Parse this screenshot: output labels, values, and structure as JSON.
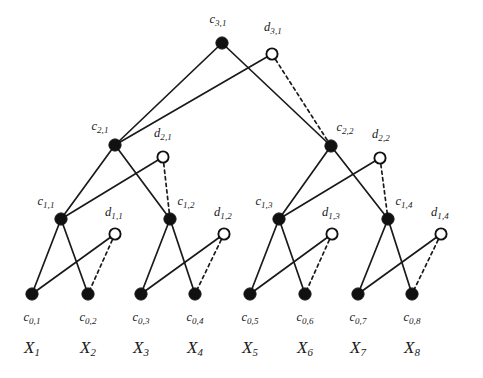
{
  "figure": {
    "type": "tree-diagram",
    "background_color": "#ffffff",
    "line_color": "#1a1a1a",
    "filled_node_color": "#111111",
    "open_node_fill": "#ffffff",
    "levels": 4,
    "leaf_count": 8
  },
  "nodes": {
    "approximation": [
      {
        "id": "c3_1",
        "label_c": "c",
        "label_sub": "3,1",
        "x": 222,
        "y": 43,
        "label_x": 218,
        "label_y": 19,
        "style": "filled",
        "level": 3
      },
      {
        "id": "c2_1",
        "label_c": "c",
        "label_sub": "2,1",
        "x": 115,
        "y": 145,
        "label_x": 100,
        "label_y": 126,
        "style": "filled",
        "level": 2
      },
      {
        "id": "c2_2",
        "label_c": "c",
        "label_sub": "2,2",
        "x": 331,
        "y": 146,
        "label_x": 345,
        "label_y": 127,
        "style": "filled",
        "level": 2
      },
      {
        "id": "c1_1",
        "label_c": "c",
        "label_sub": "1,1",
        "x": 61,
        "y": 219,
        "label_x": 46,
        "label_y": 201,
        "style": "filled",
        "level": 1
      },
      {
        "id": "c1_2",
        "label_c": "c",
        "label_sub": "1,2",
        "x": 170,
        "y": 219,
        "label_x": 186,
        "label_y": 201,
        "style": "filled",
        "level": 1
      },
      {
        "id": "c1_3",
        "label_c": "c",
        "label_sub": "1,3",
        "x": 279,
        "y": 219,
        "label_x": 264,
        "label_y": 201,
        "style": "filled",
        "level": 1
      },
      {
        "id": "c1_4",
        "label_c": "c",
        "label_sub": "1,4",
        "x": 388,
        "y": 219,
        "label_x": 404,
        "label_y": 201,
        "style": "filled",
        "level": 1
      },
      {
        "id": "c0_1",
        "label_c": "c",
        "label_sub": "0,1",
        "x": 32,
        "y": 294,
        "label_x": 32,
        "label_y": 317,
        "style": "filled",
        "level": 0
      },
      {
        "id": "c0_2",
        "label_c": "c",
        "label_sub": "0,2",
        "x": 88,
        "y": 294,
        "label_x": 88,
        "label_y": 317,
        "style": "filled",
        "level": 0
      },
      {
        "id": "c0_3",
        "label_c": "c",
        "label_sub": "0,3",
        "x": 141,
        "y": 294,
        "label_x": 141,
        "label_y": 317,
        "style": "filled",
        "level": 0
      },
      {
        "id": "c0_4",
        "label_c": "c",
        "label_sub": "0,4",
        "x": 195,
        "y": 294,
        "label_x": 195,
        "label_y": 317,
        "style": "filled",
        "level": 0
      },
      {
        "id": "c0_5",
        "label_c": "c",
        "label_sub": "0,5",
        "x": 250,
        "y": 294,
        "label_x": 250,
        "label_y": 317,
        "style": "filled",
        "level": 0
      },
      {
        "id": "c0_6",
        "label_c": "c",
        "label_sub": "0,6",
        "x": 305,
        "y": 294,
        "label_x": 305,
        "label_y": 317,
        "style": "filled",
        "level": 0
      },
      {
        "id": "c0_7",
        "label_c": "c",
        "label_sub": "0,7",
        "x": 358,
        "y": 294,
        "label_x": 358,
        "label_y": 317,
        "style": "filled",
        "level": 0
      },
      {
        "id": "c0_8",
        "label_c": "c",
        "label_sub": "0,8",
        "x": 412,
        "y": 294,
        "label_x": 412,
        "label_y": 317,
        "style": "filled",
        "level": 0
      }
    ],
    "detail": [
      {
        "id": "d3_1",
        "label_c": "d",
        "label_sub": "3,1",
        "x": 272,
        "y": 54,
        "label_x": 273,
        "label_y": 27,
        "style": "open",
        "level": 3
      },
      {
        "id": "d2_1",
        "label_c": "d",
        "label_sub": "2,1",
        "x": 163,
        "y": 157,
        "label_x": 163,
        "label_y": 133,
        "style": "open",
        "level": 2
      },
      {
        "id": "d2_2",
        "label_c": "d",
        "label_sub": "2,2",
        "x": 380,
        "y": 158,
        "label_x": 381,
        "label_y": 134,
        "style": "open",
        "level": 2
      },
      {
        "id": "d1_1",
        "label_c": "d",
        "label_sub": "1,1",
        "x": 115,
        "y": 234,
        "label_x": 114,
        "label_y": 212,
        "style": "open",
        "level": 1
      },
      {
        "id": "d1_2",
        "label_c": "d",
        "label_sub": "1,2",
        "x": 224,
        "y": 234,
        "label_x": 223,
        "label_y": 212,
        "style": "open",
        "level": 1
      },
      {
        "id": "d1_3",
        "label_c": "d",
        "label_sub": "1,3",
        "x": 332,
        "y": 234,
        "label_x": 331,
        "label_y": 212,
        "style": "open",
        "level": 1
      },
      {
        "id": "d1_4",
        "label_c": "d",
        "label_sub": "1,4",
        "x": 441,
        "y": 234,
        "label_x": 440,
        "label_y": 212,
        "style": "open",
        "level": 1
      }
    ]
  },
  "signal_labels": [
    {
      "id": "X1",
      "label_x": "X",
      "label_sub": "1",
      "x": 32,
      "y": 347
    },
    {
      "id": "X2",
      "label_x": "X",
      "label_sub": "2",
      "x": 88,
      "y": 347
    },
    {
      "id": "X3",
      "label_x": "X",
      "label_sub": "3",
      "x": 141,
      "y": 347
    },
    {
      "id": "X4",
      "label_x": "X",
      "label_sub": "4",
      "x": 195,
      "y": 347
    },
    {
      "id": "X5",
      "label_x": "X",
      "label_sub": "5",
      "x": 250,
      "y": 347
    },
    {
      "id": "X6",
      "label_x": "X",
      "label_sub": "6",
      "x": 305,
      "y": 347
    },
    {
      "id": "X7",
      "label_x": "X",
      "label_sub": "7",
      "x": 358,
      "y": 347
    },
    {
      "id": "X8",
      "label_x": "X",
      "label_sub": "8",
      "x": 412,
      "y": 347
    }
  ],
  "edges": [
    {
      "from": "c3_1",
      "to": "c2_1",
      "style": "solid"
    },
    {
      "from": "c3_1",
      "to": "c2_2",
      "style": "solid"
    },
    {
      "from": "d3_1",
      "to": "c2_1",
      "style": "solid"
    },
    {
      "from": "d3_1",
      "to": "c2_2",
      "style": "dashed"
    },
    {
      "from": "c2_1",
      "to": "c1_1",
      "style": "solid"
    },
    {
      "from": "c2_1",
      "to": "c1_2",
      "style": "solid"
    },
    {
      "from": "d2_1",
      "to": "c1_1",
      "style": "solid"
    },
    {
      "from": "d2_1",
      "to": "c1_2",
      "style": "dashed"
    },
    {
      "from": "c2_2",
      "to": "c1_3",
      "style": "solid"
    },
    {
      "from": "c2_2",
      "to": "c1_4",
      "style": "solid"
    },
    {
      "from": "d2_2",
      "to": "c1_3",
      "style": "solid"
    },
    {
      "from": "d2_2",
      "to": "c1_4",
      "style": "dashed"
    },
    {
      "from": "c1_1",
      "to": "c0_1",
      "style": "solid"
    },
    {
      "from": "c1_1",
      "to": "c0_2",
      "style": "solid"
    },
    {
      "from": "d1_1",
      "to": "c0_1",
      "style": "solid"
    },
    {
      "from": "d1_1",
      "to": "c0_2",
      "style": "dashed"
    },
    {
      "from": "c1_2",
      "to": "c0_3",
      "style": "solid"
    },
    {
      "from": "c1_2",
      "to": "c0_4",
      "style": "solid"
    },
    {
      "from": "d1_2",
      "to": "c0_3",
      "style": "solid"
    },
    {
      "from": "d1_2",
      "to": "c0_4",
      "style": "dashed"
    },
    {
      "from": "c1_3",
      "to": "c0_5",
      "style": "solid"
    },
    {
      "from": "c1_3",
      "to": "c0_6",
      "style": "solid"
    },
    {
      "from": "d1_3",
      "to": "c0_5",
      "style": "solid"
    },
    {
      "from": "d1_3",
      "to": "c0_6",
      "style": "dashed"
    },
    {
      "from": "c1_4",
      "to": "c0_7",
      "style": "solid"
    },
    {
      "from": "c1_4",
      "to": "c0_8",
      "style": "solid"
    },
    {
      "from": "d1_4",
      "to": "c0_7",
      "style": "solid"
    },
    {
      "from": "d1_4",
      "to": "c0_8",
      "style": "dashed"
    }
  ]
}
